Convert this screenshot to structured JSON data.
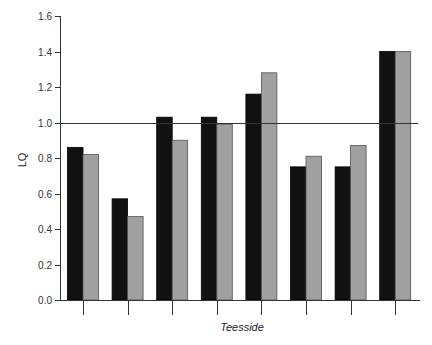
{
  "chart_data": {
    "type": "bar",
    "title": "",
    "xlabel": "Teesside",
    "ylabel": "LQ",
    "ylim": [
      0.0,
      1.6
    ],
    "yticks": [
      "0.0",
      "0.2",
      "0.4",
      "0.6",
      "0.8",
      "1.0",
      "1.2",
      "1.4",
      "1.6"
    ],
    "categories": [
      "",
      "",
      "",
      "",
      "",
      "",
      "",
      ""
    ],
    "series": [
      {
        "name": "Series 1",
        "color": "#111111",
        "values": [
          0.86,
          0.57,
          1.03,
          1.03,
          1.16,
          0.75,
          0.75,
          1.4
        ]
      },
      {
        "name": "Series 2",
        "color": "#a0a0a0",
        "values": [
          0.82,
          0.47,
          0.9,
          0.99,
          1.28,
          0.81,
          0.87,
          1.4
        ]
      }
    ],
    "reference_line": {
      "y": 1.0,
      "color": "#333333"
    },
    "grid": false,
    "legend": null
  },
  "axes": {
    "x_title": "Teesside",
    "y_title": "LQ"
  }
}
